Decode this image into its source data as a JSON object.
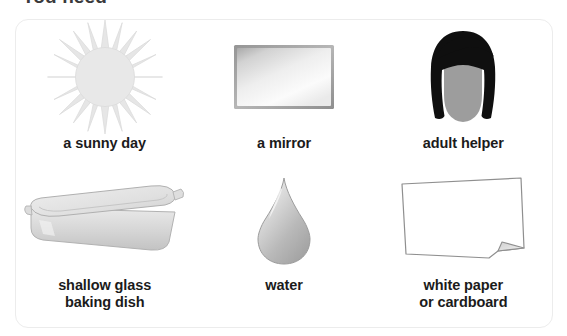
{
  "heading": {
    "text": "You need"
  },
  "card": {
    "background_color": "#ffffff",
    "border_color": "#ececec"
  },
  "items": [
    {
      "icon": "sun-icon",
      "label": "a sunny day",
      "color": "#e3e3e3"
    },
    {
      "icon": "mirror-icon",
      "label": "a mirror",
      "color": "#d6d6d6"
    },
    {
      "icon": "adult-helper-icon",
      "label": "adult helper",
      "color": "#111111"
    },
    {
      "icon": "baking-dish-icon",
      "label": "shallow glass\nbaking dish",
      "color": "#d9d9d9"
    },
    {
      "icon": "water-drop-icon",
      "label": "water",
      "color": "#bdbdbd"
    },
    {
      "icon": "paper-sheet-icon",
      "label": "white paper\nor cardboard",
      "color": "#ffffff"
    }
  ]
}
